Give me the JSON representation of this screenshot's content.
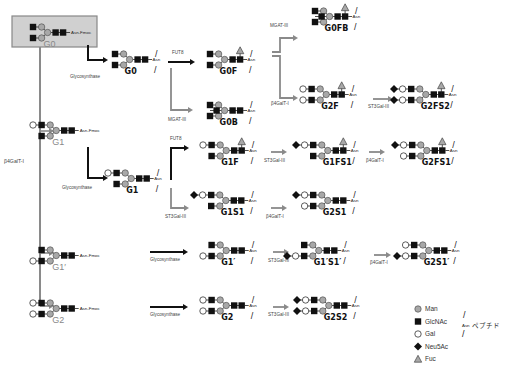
{
  "colors": {
    "man_fill": "#a8a8a8",
    "glcnac_fill": "#111111",
    "gal_fill": "#ffffff",
    "neu5ac_fill": "#111111",
    "fuc_fill": "#a8a8a8",
    "arrow_black": "#111111",
    "arrow_gray": "#8a8a8a",
    "start_box_fill": "#d0d0d0",
    "start_box_border": "#888888"
  },
  "starting_material": {
    "name": "G0",
    "tail": "Asn-Fmoc",
    "box": true
  },
  "side_label": "β4GalT-I",
  "compounds": [
    {
      "id": "G0-fmoc",
      "name": "G0",
      "x": 33,
      "y": 27,
      "upper": [
        "GlcNAc"
      ],
      "lower": [
        "GlcNAc"
      ],
      "bisect": false,
      "fuc": false,
      "tail": "Asn-Fmoc",
      "gray_name": true
    },
    {
      "id": "G1-fmoc",
      "name": "G1",
      "x": 33,
      "y": 125,
      "upper": [
        "Gal",
        "GlcNAc"
      ],
      "lower": [
        "GlcNAc"
      ],
      "bisect": false,
      "fuc": false,
      "tail": "Asn-Fmoc",
      "gray_name": true
    },
    {
      "id": "G1p-fmoc",
      "name": "G1′",
      "x": 33,
      "y": 250,
      "upper": [
        "GlcNAc"
      ],
      "lower": [
        "Gal",
        "GlcNAc"
      ],
      "bisect": false,
      "fuc": false,
      "tail": "Asn-Fmoc",
      "gray_name": true
    },
    {
      "id": "G2-fmoc",
      "name": "G2",
      "x": 33,
      "y": 303,
      "upper": [
        "Gal",
        "GlcNAc"
      ],
      "lower": [
        "Gal",
        "GlcNAc"
      ],
      "bisect": false,
      "fuc": false,
      "tail": "Asn-Fmoc",
      "gray_name": true
    },
    {
      "id": "G0",
      "name": "G0",
      "x": 115,
      "y": 54,
      "upper": [
        "GlcNAc"
      ],
      "lower": [
        "GlcNAc"
      ],
      "bisect": false,
      "fuc": false,
      "tail": "Asn"
    },
    {
      "id": "G1",
      "name": "G1",
      "x": 108,
      "y": 173,
      "upper": [
        "Gal",
        "GlcNAc"
      ],
      "lower": [
        "GlcNAc"
      ],
      "bisect": false,
      "fuc": false,
      "tail": "Asn"
    },
    {
      "id": "G0F",
      "name": "G0F",
      "x": 210,
      "y": 54,
      "upper": [
        "GlcNAc"
      ],
      "lower": [
        "GlcNAc"
      ],
      "bisect": false,
      "fuc": true,
      "tail": "Asn"
    },
    {
      "id": "G0B",
      "name": "G0B",
      "x": 210,
      "y": 105,
      "upper": [
        "GlcNAc"
      ],
      "lower": [
        "GlcNAc"
      ],
      "bisect": true,
      "fuc": false,
      "tail": "Asn"
    },
    {
      "id": "G0FB",
      "name": "G0FB",
      "x": 315,
      "y": 11,
      "upper": [
        "GlcNAc"
      ],
      "lower": [
        "GlcNAc"
      ],
      "bisect": true,
      "fuc": true,
      "tail": "Asn"
    },
    {
      "id": "G2F",
      "name": "G2F",
      "x": 303,
      "y": 89,
      "upper": [
        "Gal",
        "GlcNAc"
      ],
      "lower": [
        "Gal",
        "GlcNAc"
      ],
      "bisect": false,
      "fuc": true,
      "tail": "Asn"
    },
    {
      "id": "G2FS2",
      "name": "G2FS2",
      "x": 394,
      "y": 89,
      "upper": [
        "Neu5Ac",
        "Gal",
        "GlcNAc"
      ],
      "lower": [
        "Neu5Ac",
        "Gal",
        "GlcNAc"
      ],
      "bisect": false,
      "fuc": true,
      "tail": "Asn"
    },
    {
      "id": "G1F",
      "name": "G1F",
      "x": 203,
      "y": 145,
      "upper": [
        "Gal",
        "GlcNAc"
      ],
      "lower": [
        "GlcNAc"
      ],
      "bisect": false,
      "fuc": true,
      "tail": "Asn"
    },
    {
      "id": "G1S1",
      "name": "G1S1",
      "x": 194,
      "y": 195,
      "upper": [
        "Neu5Ac",
        "Gal",
        "GlcNAc"
      ],
      "lower": [
        "GlcNAc"
      ],
      "bisect": false,
      "fuc": false,
      "tail": "Asn"
    },
    {
      "id": "G1FS1",
      "name": "G1FS1",
      "x": 296,
      "y": 145,
      "upper": [
        "Neu5Ac",
        "Gal",
        "GlcNAc"
      ],
      "lower": [
        "GlcNAc"
      ],
      "bisect": false,
      "fuc": true,
      "tail": "Asn"
    },
    {
      "id": "G2S1",
      "name": "G2S1",
      "x": 296,
      "y": 195,
      "upper": [
        "Neu5Ac",
        "Gal",
        "GlcNAc"
      ],
      "lower": [
        "Gal",
        "GlcNAc"
      ],
      "bisect": false,
      "fuc": false,
      "tail": "Asn"
    },
    {
      "id": "G2FS1",
      "name": "G2FS1",
      "x": 395,
      "y": 145,
      "upper": [
        "Neu5Ac",
        "Gal",
        "GlcNAc"
      ],
      "lower": [
        "Gal",
        "GlcNAc"
      ],
      "bisect": false,
      "fuc": true,
      "tail": "Asn"
    },
    {
      "id": "G1p",
      "name": "G1′",
      "x": 203,
      "y": 245,
      "upper": [
        "GlcNAc"
      ],
      "lower": [
        "Gal",
        "GlcNAc"
      ],
      "bisect": false,
      "fuc": false,
      "tail": "Asn"
    },
    {
      "id": "G1pS1p",
      "name": "G1′S1′",
      "x": 287,
      "y": 245,
      "upper": [
        "GlcNAc"
      ],
      "lower": [
        "Neu5Ac",
        "Gal",
        "GlcNAc"
      ],
      "bisect": false,
      "fuc": false,
      "tail": "Asn"
    },
    {
      "id": "G2S1p",
      "name": "G2S1′",
      "x": 397,
      "y": 245,
      "upper": [
        "Gal",
        "GlcNAc"
      ],
      "lower": [
        "Neu5Ac",
        "Gal",
        "GlcNAc"
      ],
      "bisect": false,
      "fuc": false,
      "tail": "Asn"
    },
    {
      "id": "G2",
      "name": "G2",
      "x": 203,
      "y": 300,
      "upper": [
        "Gal",
        "GlcNAc"
      ],
      "lower": [
        "Gal",
        "GlcNAc"
      ],
      "bisect": false,
      "fuc": false,
      "tail": "Asn"
    },
    {
      "id": "G2S2",
      "name": "G2S2",
      "x": 297,
      "y": 300,
      "upper": [
        "Neu5Ac",
        "Gal",
        "GlcNAc"
      ],
      "lower": [
        "Neu5Ac",
        "Gal",
        "GlcNAc"
      ],
      "bisect": false,
      "fuc": false,
      "tail": "Asn"
    }
  ],
  "arrows": [
    {
      "from": "G0-fmoc->G0",
      "label": "Glycosynthase",
      "color": "black",
      "path": "M88,45 L88,60 L103,60",
      "lx": 70,
      "ly": 78
    },
    {
      "from": "G0->G0F",
      "label": "FUT8",
      "color": "black",
      "path": "M168,62 L190,62",
      "lx": 172,
      "ly": 54
    },
    {
      "from": "G0->G0B",
      "label": "MGAT-III",
      "color": "gray",
      "path": "M171,68 L171,110 L188,110",
      "lx": 168,
      "ly": 121
    },
    {
      "from": "G0F->G0FB",
      "label": "MGAT-III",
      "color": "gray",
      "path": "M272,52 L280,52 L280,38 L293,38",
      "lx": 270,
      "ly": 27
    },
    {
      "from": "G0F->G2F",
      "label": "β4GalT-I",
      "color": "gray",
      "path": "M272,56 L280,56 L280,98 L293,98",
      "lx": 271,
      "ly": 105
    },
    {
      "from": "G2F->G2FS2",
      "label": "ST3Gal-III",
      "color": "gray",
      "path": "M373,99 L388,99",
      "lx": 368,
      "ly": 108
    },
    {
      "from": "G1-fmoc->G1",
      "label": "Glycosynthase",
      "color": "black",
      "path": "M88,147 L88,178 L103,178",
      "lx": 62,
      "ly": 189
    },
    {
      "from": "G1->G1F",
      "label": "FUT8",
      "color": "black",
      "path": "M171,180 L171,148 L184,148",
      "lx": 170,
      "ly": 140
    },
    {
      "from": "G1->G1S1",
      "label": "ST3Gal-III",
      "color": "gray",
      "path": "M171,188 L171,208 L184,208",
      "lx": 165,
      "ly": 218
    },
    {
      "from": "G1F->G1FS1",
      "label": "ST3Gal-III",
      "color": "gray",
      "path": "M271,152 L282,152",
      "lx": 264,
      "ly": 162
    },
    {
      "from": "G1S1->G2S1",
      "label": "β4GalT-I",
      "color": "gray",
      "path": "M271,208 L282,208",
      "lx": 266,
      "ly": 218
    },
    {
      "from": "G1FS1->G2FS1",
      "label": "β4GalT-I",
      "color": "gray",
      "path": "M369,152 L380,152",
      "lx": 366,
      "ly": 162
    },
    {
      "from": "G1p-fmoc->G1p",
      "label": "Glycosynthase",
      "color": "black",
      "path": "M150,252 L183,252",
      "lx": 150,
      "ly": 261
    },
    {
      "from": "G1p->G1pS1p",
      "label": "ST3Gal-III",
      "color": "gray",
      "path": "M273,252 L284,252",
      "lx": 268,
      "ly": 262
    },
    {
      "from": "G1pS1p->G2S1p",
      "label": "β4GalT-I",
      "color": "gray",
      "path": "M374,255 L386,255",
      "lx": 370,
      "ly": 264
    },
    {
      "from": "G2-fmoc->G2",
      "label": "Glycosynthase",
      "color": "black",
      "path": "M150,307 L183,307",
      "lx": 150,
      "ly": 316
    },
    {
      "from": "G2->G2S2",
      "label": "ST3Gal-III",
      "color": "gray",
      "path": "M273,307 L284,307",
      "lx": 268,
      "ly": 316
    }
  ],
  "legend": {
    "items": [
      {
        "symbol": "Man",
        "label": "Man"
      },
      {
        "symbol": "GlcNAc",
        "label": "GlcNAc"
      },
      {
        "symbol": "Gal",
        "label": "Gal"
      },
      {
        "symbol": "Neu5Ac",
        "label": "Neu5Ac"
      },
      {
        "symbol": "Fuc",
        "label": "Fuc"
      }
    ],
    "peptide_asn": "Asn",
    "peptide_label": "ペプチド"
  }
}
